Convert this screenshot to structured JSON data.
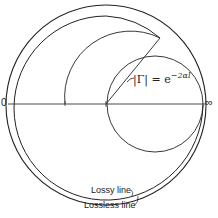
{
  "diagram": {
    "type": "Smith chart sketch (lossy vs lossless transmission line locus)",
    "left_axis_label": "0",
    "right_axis_label": "∞",
    "formula": {
      "lhs": "|Γ| = e",
      "exponent": "−2αl"
    },
    "annotations": {
      "lossy": "Lossy line",
      "lossless": "Lossless line"
    },
    "colors": {
      "stroke": "#222222",
      "background": "#ffffff"
    }
  }
}
